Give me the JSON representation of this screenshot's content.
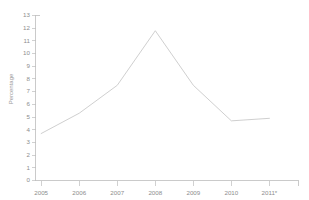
{
  "chart_data": {
    "type": "line",
    "title": "",
    "xlabel": "",
    "ylabel": "Percentage",
    "categories": [
      "2005",
      "2006",
      "2007",
      "2008",
      "2009",
      "2010",
      "2011*"
    ],
    "values": [
      3.7,
      5.3,
      7.5,
      11.8,
      7.5,
      4.7,
      4.9
    ],
    "series": [
      {
        "name": "Percentage",
        "values": [
          3.7,
          5.3,
          7.5,
          11.8,
          7.5,
          4.7,
          4.9
        ]
      }
    ],
    "ylim": [
      0,
      13
    ],
    "ytick_labels": [
      "0",
      "1",
      "2",
      "3",
      "4",
      "5",
      "6",
      "7",
      "8",
      "9",
      "10",
      "11",
      "12",
      "13"
    ],
    "ytick_values": [
      0,
      1,
      2,
      3,
      4,
      5,
      6,
      7,
      8,
      9,
      10,
      11,
      12,
      13
    ],
    "grid": false,
    "legend": "none",
    "line_color": "#c9c9c9",
    "axis_color": "#bdbdbd",
    "text_color": "#8d8d8d",
    "footnote_marker": "*"
  },
  "axes": {
    "y_axis_label": "Percentage",
    "x_axis_label": ""
  }
}
